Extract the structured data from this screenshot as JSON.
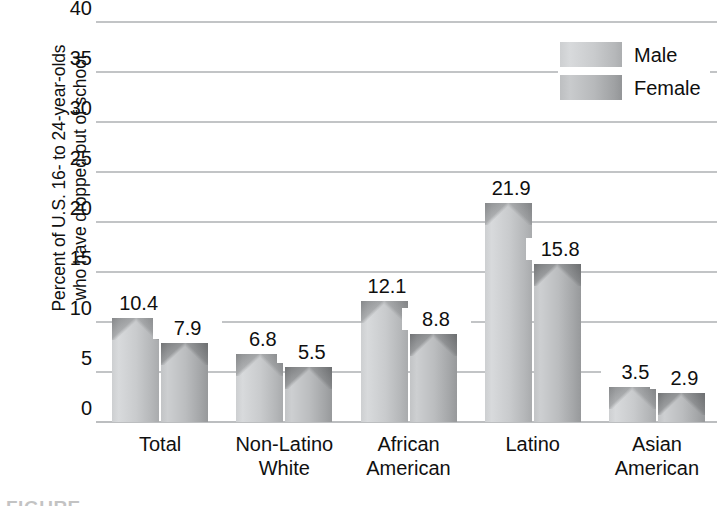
{
  "chart_data": {
    "type": "bar",
    "title": "",
    "xlabel": "",
    "ylabel": "Percent of U.S. 16- to 24-year-olds who have dropped out of school",
    "ylabel_lines": [
      "Percent of U.S. 16- to 24-year-olds",
      "who have dropped out of school"
    ],
    "categories": [
      "Total",
      "Non-Latino White",
      "African American",
      "Latino",
      "Asian American"
    ],
    "category_lines": [
      [
        "Total",
        ""
      ],
      [
        "Non-Latino",
        "White"
      ],
      [
        "African",
        "American"
      ],
      [
        "Latino",
        ""
      ],
      [
        "Asian",
        "American"
      ]
    ],
    "series": [
      {
        "name": "Male",
        "values": [
          10.4,
          6.8,
          12.1,
          21.9,
          3.5
        ],
        "color": "#cdcfd1"
      },
      {
        "name": "Female",
        "values": [
          7.9,
          5.5,
          8.8,
          15.8,
          2.9
        ],
        "color": "#b7b9bb"
      }
    ],
    "ylim": [
      0,
      40
    ],
    "yticks": [
      0,
      5,
      10,
      15,
      20,
      25,
      30,
      35,
      40
    ],
    "ytick_labels": [
      "0",
      "5",
      "10",
      "15",
      "20",
      "25",
      "30",
      "35",
      "40"
    ],
    "grid": true,
    "grid_color": "#c2c4c6",
    "legend_position": "top-right",
    "value_labels": true
  },
  "legend": {
    "entries": [
      {
        "label": "Male",
        "swatch": "male-swatch"
      },
      {
        "label": "Female",
        "swatch": "female-swatch"
      }
    ]
  },
  "caption": {
    "text": "FIGURE"
  }
}
